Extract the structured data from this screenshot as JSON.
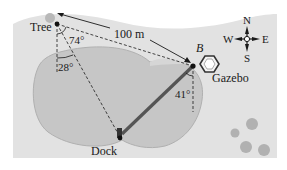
{
  "figure": {
    "type": "geometry-word-problem-map",
    "colors": {
      "background": "#ffffff",
      "land": "#e2e2e2",
      "lake": "#c6c6c6",
      "lake_edge": "#b0b0b0",
      "bridge": "#555555",
      "ink": "#1a1a1a",
      "shrubs": "#a9a9a9"
    },
    "points": {
      "tree": {
        "label": "Tree",
        "x": 57,
        "y": 24
      },
      "b": {
        "label": "B",
        "x": 193,
        "y": 66
      },
      "dock": {
        "label": "Dock",
        "x": 120,
        "y": 137
      }
    },
    "labels": {
      "distance": "100 m",
      "gazebo": "Gazebo",
      "angle_tree_top": "74°",
      "angle_tree_bottom": "28°",
      "angle_b": "41°"
    },
    "compass": {
      "n": "N",
      "s": "S",
      "e": "E",
      "w": "W"
    }
  }
}
